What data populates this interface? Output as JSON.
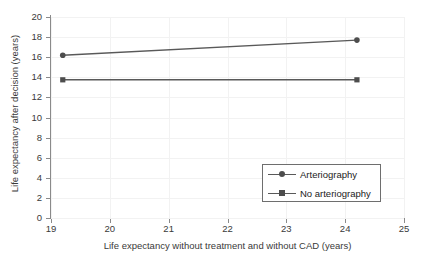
{
  "chart_data": {
    "type": "line",
    "title": "",
    "xlabel": "Life expectancy without treatment and without CAD (years)",
    "ylabel": "Life expectancy after decision (years)",
    "xlim": [
      19,
      25
    ],
    "ylim": [
      0,
      20
    ],
    "xticks": [
      19,
      20,
      21,
      22,
      23,
      24,
      25
    ],
    "yticks": [
      0,
      2,
      4,
      6,
      8,
      10,
      12,
      14,
      16,
      18,
      20
    ],
    "xtick_labels": [
      "19",
      "20",
      "21",
      "22",
      "23",
      "24",
      "25"
    ],
    "ytick_labels": [
      "0",
      "2",
      "4",
      "6",
      "8",
      "10",
      "12",
      "14",
      "16",
      "18",
      "20"
    ],
    "grid": true,
    "legend_position": "lower right",
    "series": [
      {
        "name": "Arteriography",
        "marker": "circle",
        "color": "#595959",
        "x": [
          19.2,
          24.2
        ],
        "values": [
          16.2,
          17.7
        ]
      },
      {
        "name": "No arteriography",
        "marker": "square",
        "color": "#595959",
        "x": [
          19.2,
          24.2
        ],
        "values": [
          13.75,
          13.75
        ]
      }
    ]
  },
  "legend": {
    "entries": [
      {
        "label": "Arteriography",
        "marker_icon": "circle-marker-icon"
      },
      {
        "label": "No arteriography",
        "marker_icon": "square-marker-icon"
      }
    ]
  },
  "colors": {
    "axis": "#8a8a8a",
    "grid": "#f2f2f2",
    "series": "#595959",
    "marker": "#4d4d4d",
    "text": "#3a3a3a",
    "legend_border": "#6e6e6e",
    "background": "#ffffff"
  }
}
